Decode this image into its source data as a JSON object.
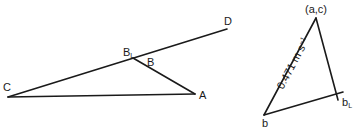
{
  "space_diagram": {
    "points": {
      "C": {
        "label": "C",
        "x": 8,
        "y": 97
      },
      "A": {
        "label": "A",
        "x": 195,
        "y": 94
      },
      "BL": {
        "label": "B",
        "sub": "L",
        "x": 133,
        "y": 58
      },
      "B": {
        "label": "B"
      },
      "D": {
        "label": "D",
        "x": 227,
        "y": 29
      }
    },
    "links": [
      "C-A",
      "C-D",
      "BL-A"
    ]
  },
  "velocity_diagram": {
    "points": {
      "ac": {
        "label": "(a,c)",
        "x": 316,
        "y": 18
      },
      "b": {
        "label": "b",
        "x": 264,
        "y": 115
      },
      "bL": {
        "label": "b",
        "sub": "L",
        "x": 337,
        "y": 98
      }
    },
    "velocity_label": {
      "value": "0.471",
      "unit": "m s",
      "exponent": "−1"
    },
    "links": [
      "ac-b",
      "ac-bL",
      "b-bL"
    ]
  }
}
